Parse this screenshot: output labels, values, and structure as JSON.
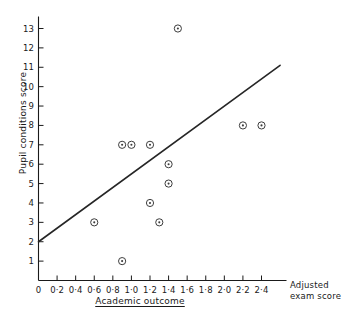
{
  "chart_data": {
    "type": "scatter",
    "title": "",
    "xlabel": "Academic outcome",
    "ylabel": "Pupil conditions score",
    "x_axis_end_label": "Adjusted exam score",
    "xlim": [
      0,
      2.6
    ],
    "ylim": [
      0,
      13.6
    ],
    "grid": false,
    "legend": null,
    "x_ticks": [
      {
        "value": 0,
        "label": "0"
      },
      {
        "value": 0.2,
        "label": "0·2"
      },
      {
        "value": 0.4,
        "label": "0·4"
      },
      {
        "value": 0.6,
        "label": "0·6"
      },
      {
        "value": 0.8,
        "label": "0·8"
      },
      {
        "value": 1.0,
        "label": "1·0"
      },
      {
        "value": 1.2,
        "label": "1·2"
      },
      {
        "value": 1.4,
        "label": "1·4"
      },
      {
        "value": 1.6,
        "label": "1·6"
      },
      {
        "value": 1.8,
        "label": "1·8"
      },
      {
        "value": 2.0,
        "label": "2·0"
      },
      {
        "value": 2.2,
        "label": "2·2"
      },
      {
        "value": 2.4,
        "label": "2·4"
      }
    ],
    "y_ticks": [
      {
        "value": 1,
        "label": "1"
      },
      {
        "value": 2,
        "label": "2"
      },
      {
        "value": 3,
        "label": "3"
      },
      {
        "value": 4,
        "label": "4"
      },
      {
        "value": 5,
        "label": "5"
      },
      {
        "value": 6,
        "label": "6"
      },
      {
        "value": 7,
        "label": "7"
      },
      {
        "value": 8,
        "label": "8"
      },
      {
        "value": 9,
        "label": "9"
      },
      {
        "value": 10,
        "label": "10"
      },
      {
        "value": 11,
        "label": "11"
      },
      {
        "value": 12,
        "label": "12"
      },
      {
        "value": 13,
        "label": "13"
      }
    ],
    "points": [
      {
        "x": 0.6,
        "y": 3
      },
      {
        "x": 0.9,
        "y": 7
      },
      {
        "x": 0.9,
        "y": 1
      },
      {
        "x": 1.0,
        "y": 7
      },
      {
        "x": 1.2,
        "y": 7
      },
      {
        "x": 1.2,
        "y": 4
      },
      {
        "x": 1.3,
        "y": 3
      },
      {
        "x": 1.4,
        "y": 6
      },
      {
        "x": 1.4,
        "y": 5
      },
      {
        "x": 1.5,
        "y": 13
      },
      {
        "x": 2.2,
        "y": 8
      },
      {
        "x": 2.4,
        "y": 8
      }
    ],
    "fit_line": {
      "x_start": 0.0,
      "y_start": 2.0,
      "x_end": 2.6,
      "y_end": 11.1
    },
    "marker_style": "circle-with-center-dot",
    "colors": {
      "axis": "#1a1a1a",
      "marker": "#3d3d3d",
      "fit_line": "#262626",
      "background": "#ffffff"
    }
  }
}
